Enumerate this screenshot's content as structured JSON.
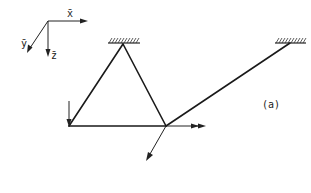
{
  "diagram": {
    "type": "structural-frame",
    "caption": "(a)",
    "colors": {
      "line": "#1a1a1a",
      "background": "#ffffff"
    },
    "coordinate_system": {
      "origin": [
        48,
        21
      ],
      "axes": [
        {
          "name": "x",
          "label": "x̄",
          "direction": "right"
        },
        {
          "name": "y",
          "label": "ȳ",
          "direction": "down-left"
        },
        {
          "name": "z",
          "label": "z̄",
          "direction": "down"
        }
      ]
    },
    "supports": [
      {
        "id": "support-left",
        "type": "fixed",
        "position": [
          123,
          45
        ]
      },
      {
        "id": "support-right",
        "type": "fixed",
        "position": [
          290,
          44
        ]
      }
    ],
    "nodes": [
      {
        "id": "node-apex",
        "position": [
          123,
          45
        ]
      },
      {
        "id": "node-bottom-left",
        "position": [
          69,
          126
        ]
      },
      {
        "id": "node-bottom-right",
        "position": [
          166,
          126
        ]
      },
      {
        "id": "node-right-support",
        "position": [
          290,
          44
        ]
      }
    ],
    "members": [
      {
        "from": "node-apex",
        "to": "node-bottom-left"
      },
      {
        "from": "node-apex",
        "to": "node-bottom-right"
      },
      {
        "from": "node-bottom-left",
        "to": "node-bottom-right"
      },
      {
        "from": "node-bottom-right",
        "to": "node-right-support"
      }
    ],
    "loads": [
      {
        "id": "load-vertical",
        "at": "node-bottom-left",
        "type": "force",
        "direction": "down"
      },
      {
        "id": "load-horizontal",
        "at": "node-bottom-right",
        "type": "moment-double-arrow",
        "direction": "right"
      },
      {
        "id": "load-diagonal",
        "at": "node-bottom-right",
        "type": "force",
        "direction": "down-left"
      }
    ]
  }
}
